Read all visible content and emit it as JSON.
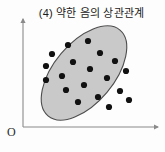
{
  "figure": {
    "title": "(4) 약한 음의 상관관계",
    "origin_label": "O",
    "background_color": "#fdfdfd"
  },
  "axes": {
    "x_axis": {
      "name": "x-axis",
      "start": [
        23,
        127
      ],
      "end": [
        160,
        127
      ],
      "arrow": true,
      "color": "#8a8a8a"
    },
    "y_axis": {
      "name": "y-axis",
      "start": [
        23,
        127
      ],
      "end": [
        23,
        18
      ],
      "arrow": true,
      "color": "#8a8a8a"
    }
  },
  "chart_data": {
    "type": "scatter",
    "title": "(4) 약한 음의 상관관계",
    "xlabel": "",
    "ylabel": "",
    "xlim": [
      0,
      165
    ],
    "ylim": [
      0,
      152
    ],
    "grid": false,
    "legend": false,
    "point_color": "#111111",
    "point_radius": 3.1,
    "correlation": "weak negative",
    "points": [
      [
        68,
        45
      ],
      [
        52,
        54
      ],
      [
        88,
        41
      ],
      [
        46,
        66
      ],
      [
        73,
        62
      ],
      [
        100,
        53
      ],
      [
        46,
        80
      ],
      [
        62,
        76
      ],
      [
        90,
        69
      ],
      [
        115,
        61
      ],
      [
        66,
        90
      ],
      [
        84,
        85
      ],
      [
        107,
        78
      ],
      [
        126,
        71
      ],
      [
        78,
        102
      ],
      [
        98,
        97
      ],
      [
        120,
        91
      ],
      [
        109,
        107
      ],
      [
        129,
        100
      ]
    ],
    "hull_ellipse": {
      "name": "correlation-ellipse",
      "cx": 84,
      "cy": 73,
      "rx": 56,
      "ry": 30,
      "rotation_deg": -50,
      "fill": "#c9c9c9",
      "stroke": "#4d4d4d",
      "stroke_width": 1.1
    }
  }
}
